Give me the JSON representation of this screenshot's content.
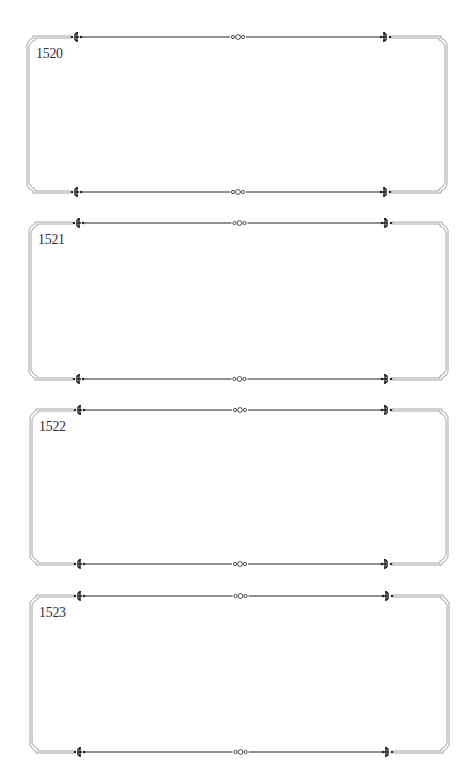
{
  "page": {
    "background": "#ffffff",
    "border_color": "#9a9a9a",
    "rule_color": "#222222"
  },
  "frames": [
    {
      "label": "1520",
      "left": 27,
      "right": 447,
      "top": 36,
      "bottom": 193
    },
    {
      "label": "1521",
      "left": 29,
      "right": 448,
      "top": 222,
      "bottom": 380
    },
    {
      "label": "1522",
      "left": 30,
      "right": 448,
      "top": 409,
      "bottom": 565
    },
    {
      "label": "1523",
      "left": 30,
      "right": 449,
      "top": 595,
      "bottom": 753
    }
  ],
  "ornaments": {
    "left": "scroll-left-icon",
    "center": "triple-ring-icon",
    "right": "scroll-right-icon"
  }
}
